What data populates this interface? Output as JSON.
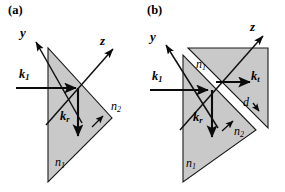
{
  "figure": {
    "type": "optics-ray-diagram",
    "width": 285,
    "height": 192,
    "background_color": "#ffffff",
    "prism_fill_color": "#c9c9c9",
    "line_color": "#0b0b0b"
  },
  "panels": [
    {
      "tag": "(a)",
      "description": "Single right-angle prism, total internal reflection at hypotenuse",
      "axes": [
        {
          "name": "y-axis",
          "label": "y"
        },
        {
          "name": "z-axis",
          "label": "z"
        }
      ],
      "vectors": [
        {
          "name": "incident-wavevector",
          "label": "k",
          "sub": "1"
        },
        {
          "name": "reflected-wavevector",
          "label": "k",
          "sub": "r"
        }
      ],
      "media": [
        {
          "name": "prism-index",
          "label": "n",
          "sub": "1"
        },
        {
          "name": "outer-index",
          "label": "n",
          "sub": "2"
        }
      ]
    },
    {
      "tag": "(b)",
      "description": "Two right-angle prisms separated by a thin gap of width d, frustrated total internal reflection",
      "axes": [
        {
          "name": "y-axis",
          "label": "y"
        },
        {
          "name": "z-axis",
          "label": "z"
        }
      ],
      "vectors": [
        {
          "name": "incident-wavevector",
          "label": "k",
          "sub": "1"
        },
        {
          "name": "reflected-wavevector",
          "label": "k",
          "sub": "r"
        },
        {
          "name": "transmitted-wavevector",
          "label": "k",
          "sub": "t"
        }
      ],
      "media": [
        {
          "name": "upper-prism-index",
          "label": "n",
          "sub": "1"
        },
        {
          "name": "lower-prism-index",
          "label": "n",
          "sub": "1"
        },
        {
          "name": "gap-index",
          "label": "n",
          "sub": "2"
        }
      ],
      "dimensions": [
        {
          "name": "gap-width",
          "label": "d"
        }
      ]
    }
  ]
}
